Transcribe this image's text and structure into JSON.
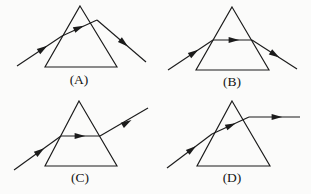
{
  "figure": {
    "background_color": "#fbfbfa",
    "ink_color": "#1b1b1b",
    "width": 311,
    "height": 194
  },
  "panels": [
    {
      "id": "panel-a",
      "label": "(A)",
      "label_pos": {
        "x": 79,
        "y": 84
      },
      "prism": {
        "apex": {
          "x": 80,
          "y": 6
        },
        "base_left": {
          "x": 45,
          "y": 67
        },
        "base_right": {
          "x": 117,
          "y": 67
        },
        "points": "80,6 117,67 45,67"
      },
      "rays": [
        {
          "name": "incident-ray",
          "x1": 17,
          "y1": 66,
          "x2": 62,
          "y2": 36,
          "arrow": {
            "x": 43,
            "y": 48.6,
            "angle": -33.7
          }
        },
        {
          "name": "refracted-ray-inside-prism",
          "x1": 62,
          "y1": 36,
          "x2": 97,
          "y2": 20,
          "arrow": {
            "x": 79,
            "y": 27.8,
            "angle": -24.6
          }
        },
        {
          "name": "emergent-ray",
          "x1": 97,
          "y1": 20,
          "x2": 146,
          "y2": 62,
          "arrow": {
            "x": 124,
            "y": 43.1,
            "angle": 40.6
          }
        }
      ]
    },
    {
      "id": "panel-b",
      "label": "(B)",
      "label_pos": {
        "x": 232,
        "y": 86
      },
      "prism": {
        "apex": {
          "x": 232,
          "y": 7
        },
        "base_left": {
          "x": 196,
          "y": 70
        },
        "base_right": {
          "x": 269,
          "y": 70
        },
        "points": "232,7 269,70 196,70"
      },
      "rays": [
        {
          "name": "incident-ray",
          "x1": 168,
          "y1": 70,
          "x2": 213,
          "y2": 40,
          "arrow": {
            "x": 194,
            "y": 52.6,
            "angle": -33.7
          }
        },
        {
          "name": "refracted-ray-inside-prism",
          "x1": 213,
          "y1": 40,
          "x2": 252,
          "y2": 40,
          "arrow": {
            "x": 234,
            "y": 40,
            "angle": 0
          }
        },
        {
          "name": "emergent-ray",
          "x1": 252,
          "y1": 40,
          "x2": 297,
          "y2": 69,
          "arrow": {
            "x": 275,
            "y": 54.8,
            "angle": 32.8
          }
        }
      ]
    },
    {
      "id": "panel-c",
      "label": "(C)",
      "label_pos": {
        "x": 80,
        "y": 182
      },
      "prism": {
        "apex": {
          "x": 79,
          "y": 101
        },
        "base_left": {
          "x": 45,
          "y": 166
        },
        "base_right": {
          "x": 117,
          "y": 166
        },
        "points": "79,101 117,166 45,166"
      },
      "rays": [
        {
          "name": "incident-ray",
          "x1": 14,
          "y1": 170,
          "x2": 61,
          "y2": 136,
          "arrow": {
            "x": 40,
            "y": 151.2,
            "angle": -35.9
          }
        },
        {
          "name": "refracted-ray-inside-prism",
          "x1": 61,
          "y1": 136,
          "x2": 100,
          "y2": 136,
          "arrow": {
            "x": 80,
            "y": 136,
            "angle": 0
          }
        },
        {
          "name": "emergent-ray",
          "x1": 100,
          "y1": 136,
          "x2": 148,
          "y2": 108,
          "arrow": {
            "x": 127,
            "y": 122.6,
            "angle": -30.3
          }
        }
      ]
    },
    {
      "id": "panel-d",
      "label": "(D)",
      "label_pos": {
        "x": 232,
        "y": 182
      },
      "prism": {
        "apex": {
          "x": 232,
          "y": 101
        },
        "base_left": {
          "x": 197,
          "y": 166
        },
        "base_right": {
          "x": 270,
          "y": 166
        },
        "points": "232,101 270,166 197,166"
      },
      "rays": [
        {
          "name": "incident-ray",
          "x1": 167,
          "y1": 168,
          "x2": 212,
          "y2": 134,
          "arrow": {
            "x": 192,
            "y": 149.1,
            "angle": -37.1
          }
        },
        {
          "name": "refracted-ray-inside-prism",
          "x1": 212,
          "y1": 134,
          "x2": 249,
          "y2": 117,
          "arrow": {
            "x": 231,
            "y": 125.3,
            "angle": -24.7
          }
        },
        {
          "name": "emergent-ray",
          "x1": 249,
          "y1": 117,
          "x2": 300,
          "y2": 117,
          "arrow": {
            "x": 277,
            "y": 117,
            "angle": 0
          }
        }
      ]
    }
  ]
}
